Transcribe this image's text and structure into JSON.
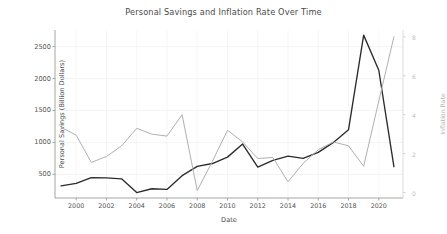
{
  "chart_data": {
    "type": "line",
    "title": "Personal Savings and Inflation Rate Over Time",
    "xlabel": "Date",
    "ylabel": "Personal Savings (Billion Dollars)",
    "ylabel_right": "Inflation Rate",
    "grid": true,
    "legend": "none",
    "x": [
      1999,
      2000,
      2001,
      2002,
      2003,
      2004,
      2005,
      2006,
      2007,
      2008,
      2009,
      2010,
      2011,
      2012,
      2013,
      2014,
      2015,
      2016,
      2017,
      2018,
      2019,
      2020,
      2021
    ],
    "xtick_labels": [
      "2000",
      "2002",
      "2004",
      "2006",
      "2008",
      "2010",
      "2012",
      "2014",
      "2016",
      "2018",
      "2020"
    ],
    "xticks": [
      2000,
      2002,
      2004,
      2006,
      2008,
      2010,
      2012,
      2014,
      2016,
      2018,
      2020
    ],
    "xlim": [
      1998.6,
      2021.6
    ],
    "yticks_left": [
      500,
      1000,
      1500,
      2000,
      2500
    ],
    "ylim_left": [
      130,
      2760
    ],
    "yticks_right": [
      0,
      2,
      4,
      6,
      8
    ],
    "ytick_labels_right": [
      "0",
      "2",
      "4",
      "6",
      "8"
    ],
    "ylim_right": [
      -0.28,
      8.35
    ],
    "series": [
      {
        "name": "Personal Savings (Billion Dollars)",
        "axis": "left",
        "color": "#2b2b2b",
        "values": [
          320,
          360,
          450,
          445,
          430,
          215,
          275,
          265,
          480,
          625,
          670,
          770,
          975,
          615,
          720,
          785,
          750,
          845,
          1000,
          1200,
          2680,
          2130,
          620
        ]
      },
      {
        "name": "Inflation Rate",
        "axis": "right",
        "color": "#b0b0b0",
        "values": [
          3.35,
          2.95,
          1.55,
          1.85,
          2.4,
          3.3,
          3.0,
          2.9,
          4.0,
          0.1,
          1.6,
          3.2,
          2.6,
          1.75,
          1.8,
          0.55,
          1.5,
          2.2,
          2.6,
          2.4,
          1.35,
          4.7,
          8.0
        ]
      }
    ]
  }
}
